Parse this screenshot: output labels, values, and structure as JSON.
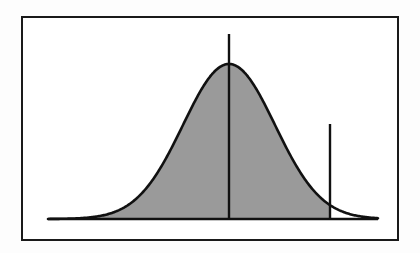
{
  "figure": {
    "title": "Normal distribution curve with shaded region",
    "background_color": "#fdfdfd",
    "frame": {
      "border_color": "#1a1a1a",
      "fill_color": "#ffffff",
      "x": 21,
      "y": 16,
      "width": 378,
      "height": 225,
      "border_width": 2
    }
  },
  "chart_data": {
    "type": "area",
    "title": "Normal distribution curve with shaded region",
    "subtitle": "",
    "xlabel": "",
    "ylabel": "",
    "grid": false,
    "legend_position": "none",
    "axis_labels_visible": false,
    "tick_labels_visible": false,
    "curve": {
      "name": "normal-density",
      "distribution": "normal",
      "mean_px": 229,
      "peak_y_px": 64,
      "baseline_y_px": 219,
      "sigma_px": 46,
      "x_start_px": 48,
      "x_end_px": 378,
      "line_color": "#111111",
      "line_width": 2.6
    },
    "shaded_region": {
      "name": "shaded-area-under-curve",
      "fill_color": "#9a9a9a",
      "from_x_px": 48,
      "to_x_px": 330,
      "description": "Area under the bell curve from the left tail up to the right vertical marker"
    },
    "markers": [
      {
        "name": "mean-line",
        "x_px": 229,
        "y_top_px": 34,
        "y_bottom_px": 219,
        "color": "#111111",
        "width": 2.4,
        "extends_above_curve": true
      },
      {
        "name": "cutoff-line",
        "x_px": 330,
        "y_top_px": 124,
        "y_bottom_px": 219,
        "color": "#111111",
        "width": 2.4,
        "extends_above_curve": true
      }
    ],
    "baseline": {
      "name": "x-axis-baseline",
      "y_px": 219,
      "x_start_px": 48,
      "x_end_px": 378,
      "color": "#111111",
      "width": 2.6
    },
    "colors": {
      "curve": "#111111",
      "fill": "#9a9a9a",
      "frame": "#1a1a1a",
      "background": "#ffffff"
    }
  }
}
